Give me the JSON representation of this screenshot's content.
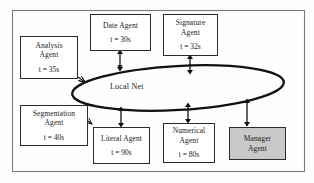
{
  "figure": {
    "title": "",
    "network": {
      "label": "Local Net",
      "shape": "ellipse"
    },
    "frame": {
      "label": "",
      "border_color": "#7a7a7a"
    }
  },
  "colors": {
    "node_fill": "#ffffff",
    "node_fill_shaded": "#c9c9c9",
    "node_stroke": "#2b2b2b",
    "bus_stroke": "#111111",
    "frame_stroke": "#7a7a7a",
    "background": "#fdfdfd"
  },
  "agents": [
    {
      "id": "analysis",
      "name": "Analysis\nAgent",
      "time": "t = 35s",
      "shaded": false,
      "connector": "diagonal-arrow"
    },
    {
      "id": "date",
      "name": "Date  Agent",
      "time": "t = 30s",
      "shaded": false,
      "connector": "double-arrow"
    },
    {
      "id": "signature",
      "name": "Signature\nAgent",
      "time": "t = 32s",
      "shaded": false,
      "connector": "double-arrow"
    },
    {
      "id": "segmentation",
      "name": "Segmentation\nAgent",
      "time": "t = 40s",
      "shaded": false,
      "connector": "diagonal-arrow"
    },
    {
      "id": "literal",
      "name": "Literal Agent",
      "time": "t = 90s",
      "shaded": false,
      "connector": "double-arrow"
    },
    {
      "id": "numerical",
      "name": "Numerical\nAgent",
      "time": "t = 80s",
      "shaded": false,
      "connector": "double-arrow"
    },
    {
      "id": "manager",
      "name": "Manager\nAgent",
      "time": "",
      "shaded": true,
      "connector": "double-arrow"
    }
  ]
}
